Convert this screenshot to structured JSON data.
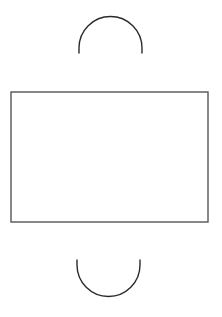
{
  "diagram": {
    "background": "#ffffff",
    "stroke_color": "#2b2b2b",
    "rect_stroke_color": "#555555",
    "top_arc": {
      "shape": "semicircle-open-down",
      "cx": 110.5,
      "cy": 48,
      "r": 31.5,
      "end_y": 53
    },
    "rectangle": {
      "x": 11,
      "y": 92,
      "width": 197,
      "height": 130
    },
    "bottom_arc": {
      "shape": "semicircle-open-up",
      "cx": 108.5,
      "cy": 265,
      "r": 31.5,
      "start_y": 260
    }
  }
}
